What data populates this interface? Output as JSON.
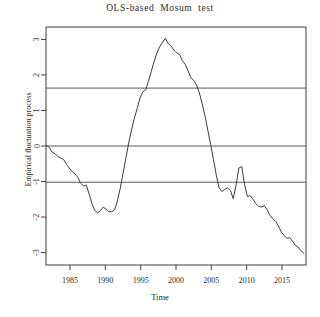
{
  "chart_data": {
    "type": "line",
    "title": "OLS-based  Mosum  test",
    "xlabel": "Time",
    "ylabel": "Empirical fluctuation process",
    "xlim": [
      1981.6,
      2018.4
    ],
    "ylim": [
      -3.35,
      3.35
    ],
    "xticks": [
      1985,
      1990,
      1995,
      2000,
      2005,
      2010,
      2015
    ],
    "xtick_labels": [
      "1985",
      "1990",
      "1995",
      "2000",
      "2005",
      "2010",
      "2015"
    ],
    "yticks": [
      3,
      2,
      1,
      0,
      -1,
      -2,
      -3
    ],
    "ytick_labels": [
      "3",
      "2",
      "1",
      "0",
      "-1",
      "-2",
      "-3"
    ],
    "grid": false,
    "legend": "none",
    "boundaries": {
      "upper": 1.63,
      "lower": -1.02,
      "zero": 0
    },
    "series": [
      {
        "name": "empirical fluctuation process",
        "color": "#3c3c3c",
        "x": [
          1981.7,
          1982.1,
          1982.5,
          1982.9,
          1983.3,
          1983.7,
          1984.1,
          1984.5,
          1984.9,
          1985.3,
          1985.7,
          1986.1,
          1986.5,
          1986.9,
          1987.3,
          1987.7,
          1988.1,
          1988.5,
          1988.9,
          1989.3,
          1989.7,
          1990.1,
          1990.5,
          1990.9,
          1991.3,
          1991.7,
          1992.1,
          1992.5,
          1992.9,
          1993.3,
          1993.7,
          1994.1,
          1994.5,
          1994.9,
          1995.3,
          1995.7,
          1996.1,
          1996.5,
          1996.9,
          1997.3,
          1997.7,
          1998.1,
          1998.5,
          1998.9,
          1999.3,
          1999.7,
          2000.1,
          2000.5,
          2000.9,
          2001.3,
          2001.7,
          2002.1,
          2002.5,
          2002.9,
          2003.3,
          2003.7,
          2004.1,
          2004.5,
          2004.9,
          2005.3,
          2005.7,
          2006.1,
          2006.5,
          2006.9,
          2007.3,
          2007.7,
          2008.1,
          2008.5,
          2008.9,
          2009.3,
          2009.7,
          2010.1,
          2010.5,
          2010.9,
          2011.3,
          2011.7,
          2012.1,
          2012.5,
          2012.9,
          2013.3,
          2013.7,
          2014.1,
          2014.5,
          2014.9,
          2015.3,
          2015.7,
          2016.1,
          2016.5,
          2016.9,
          2017.3,
          2017.7,
          2018.1
        ],
        "y": [
          0.02,
          -0.05,
          -0.18,
          -0.22,
          -0.3,
          -0.34,
          -0.38,
          -0.52,
          -0.62,
          -0.72,
          -0.78,
          -0.88,
          -1.05,
          -1.12,
          -1.1,
          -1.35,
          -1.62,
          -1.82,
          -1.88,
          -1.82,
          -1.72,
          -1.78,
          -1.85,
          -1.85,
          -1.8,
          -1.55,
          -1.2,
          -0.78,
          -0.35,
          0.08,
          0.45,
          0.78,
          1.05,
          1.35,
          1.52,
          1.58,
          1.82,
          2.1,
          2.38,
          2.62,
          2.8,
          2.92,
          3.03,
          2.88,
          2.82,
          2.7,
          2.62,
          2.58,
          2.4,
          2.3,
          2.12,
          1.92,
          1.85,
          1.72,
          1.5,
          1.2,
          0.85,
          0.45,
          0.05,
          -0.38,
          -0.82,
          -1.18,
          -1.28,
          -1.22,
          -1.18,
          -1.25,
          -1.48,
          -1.1,
          -0.62,
          -0.58,
          -1.08,
          -1.42,
          -1.4,
          -1.5,
          -1.62,
          -1.7,
          -1.72,
          -1.68,
          -1.8,
          -1.95,
          -2.05,
          -2.12,
          -2.25,
          -2.42,
          -2.52,
          -2.6,
          -2.58,
          -2.68,
          -2.8,
          -2.85,
          -2.95,
          -3.02
        ]
      }
    ]
  },
  "axes": {
    "tick_color": "#3c3c3c",
    "frame_color": "#3c3c3c",
    "boundary_color": "#5a5a5a"
  }
}
